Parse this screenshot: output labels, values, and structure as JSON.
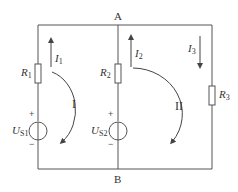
{
  "diagram": {
    "type": "circuit",
    "colors": {
      "wire": "#555555",
      "text": "#333333"
    },
    "nodes": [
      {
        "id": "A",
        "label": "A"
      },
      {
        "id": "B",
        "label": "B"
      }
    ],
    "branches": [
      {
        "name": "left",
        "resistor": {
          "symbol": "R",
          "sub": "1"
        },
        "source": {
          "symbol": "U",
          "sub": "S1",
          "plus": "+",
          "minus": "−"
        },
        "current": {
          "symbol": "I",
          "sub": "1",
          "direction": "up"
        }
      },
      {
        "name": "middle",
        "resistor": {
          "symbol": "R",
          "sub": "2"
        },
        "source": {
          "symbol": "U",
          "sub": "S2",
          "plus": "+",
          "minus": "−"
        },
        "current": {
          "symbol": "I",
          "sub": "2",
          "direction": "up"
        }
      },
      {
        "name": "right",
        "resistor": {
          "symbol": "R",
          "sub": "3"
        },
        "current": {
          "symbol": "I",
          "sub": "3",
          "direction": "down"
        }
      }
    ],
    "loops": [
      {
        "label": "I",
        "direction": "clockwise"
      },
      {
        "label": "II",
        "direction": "clockwise"
      }
    ]
  }
}
